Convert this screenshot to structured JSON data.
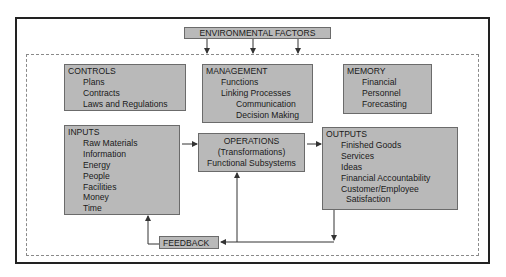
{
  "diagram": {
    "environment": {
      "label": "ENVIRONMENTAL FACTORS"
    },
    "controls": {
      "title": "CONTROLS",
      "items": [
        "Plans",
        "Contracts",
        "Laws and Regulations"
      ]
    },
    "management": {
      "title": "MANAGEMENT",
      "items": [
        "Functions",
        "Linking Processes",
        "Communication",
        "Decision Making"
      ]
    },
    "memory": {
      "title": "MEMORY",
      "items": [
        "Financial",
        "Personnel",
        "Forecasting"
      ]
    },
    "inputs": {
      "title": "INPUTS",
      "items": [
        "Raw Materials",
        "Information",
        "Energy",
        "People",
        "Facilities",
        "Money",
        "Time"
      ]
    },
    "operations": {
      "lines": [
        "OPERATIONS",
        "(Transformations)",
        "Functional Subsystems"
      ]
    },
    "outputs": {
      "title": "OUTPUTS",
      "items": [
        "Finished Goods",
        "Services",
        "Ideas",
        "Financial Accountability",
        "Customer/Employee",
        "Satisfaction"
      ]
    },
    "feedback": {
      "label": "FEEDBACK"
    },
    "colors": {
      "box_fill": "#b9b9b9",
      "box_border": "#6b6b6b",
      "frame": "#222222",
      "dotted_border": "#8a8a8a",
      "arrow": "#333333"
    }
  }
}
